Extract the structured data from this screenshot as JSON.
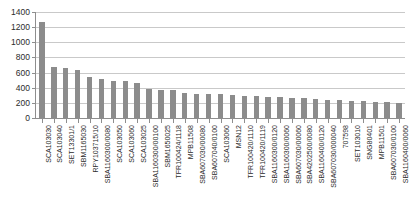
{
  "chart_data": {
    "type": "bar",
    "title": "",
    "xlabel": "",
    "ylabel": "",
    "ylim": [
      0,
      1400
    ],
    "ytick_step": 200,
    "yticks": [
      0,
      200,
      400,
      600,
      800,
      1000,
      1200,
      1400
    ],
    "grid": true,
    "legend": "none",
    "bar_color": "#8c8c8c",
    "gridline_color": "#c9c9c9",
    "axis_color": "#8e8e8e",
    "text_color": "#2b2b2b",
    "categories": [
      "SCA103030",
      "SCA103040",
      "SET13301/1",
      "SBM1165030",
      "RPY103715/10",
      "SBA1160300/0080",
      "SCA103050",
      "SCA103060",
      "SCA103025",
      "SBA1160300/00100",
      "SBM1650025",
      "TFR100424/1118",
      "MPB11508",
      "SBA607030/00080",
      "SBA607040/0100",
      "SCA103060",
      "MSN12",
      "TFR100420/1110",
      "TFR100420/1119",
      "SBA1160300/0120",
      "SBA1160300/0060",
      "SBA607030/00060",
      "SBA4202500/0080",
      "SBA1160400/0120",
      "SBA607030/000040",
      "707598",
      "SET103010",
      "SNG80401",
      "MPB11501",
      "SBA607030/0100",
      "SBA1160400/0060"
    ],
    "values": [
      1265,
      672,
      665,
      637,
      540,
      512,
      490,
      490,
      466,
      377,
      374,
      366,
      333,
      322,
      318,
      311,
      303,
      296,
      289,
      281,
      274,
      266,
      259,
      251,
      244,
      237,
      229,
      222,
      214,
      207,
      200
    ]
  }
}
